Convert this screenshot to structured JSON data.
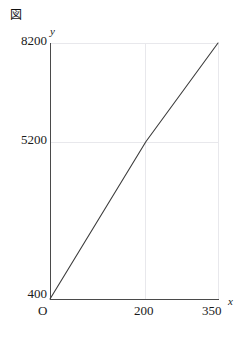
{
  "figure": {
    "marker": "図",
    "marker_name": "figure-label-cjk"
  },
  "chart_data": {
    "type": "line",
    "title": "",
    "subtitle": "",
    "xlabel": "x",
    "ylabel": "y",
    "x": [
      0,
      200,
      350
    ],
    "values": [
      400,
      5200,
      8200
    ],
    "series": [
      {
        "name": "y",
        "points": [
          {
            "x": 0,
            "y": 400
          },
          {
            "x": 200,
            "y": 5200
          },
          {
            "x": 350,
            "y": 8200
          }
        ]
      }
    ],
    "xlim": [
      0,
      350
    ],
    "ylim": [
      400,
      8200
    ],
    "xticks": [
      0,
      200,
      350
    ],
    "xtick_labels": [
      "O",
      "200",
      "350"
    ],
    "yticks": [
      400,
      5200,
      8200
    ],
    "ytick_labels": [
      "400",
      "5200",
      "8200"
    ],
    "origin_label": "O",
    "grid": true,
    "gridlines_x": [
      200,
      350
    ],
    "gridlines_y": [
      5200,
      8200
    ],
    "legend": null,
    "legend_position": "none",
    "line_color": "#3c3c3c",
    "grid_color": "#e8e8ec",
    "axis_color": "#4a4a4a",
    "annotations": []
  },
  "labels": {
    "y_8200": "8200",
    "y_5200": "5200",
    "y_400": "400",
    "x_origin": "O",
    "x_200": "200",
    "x_350": "350",
    "axis_y_name": "y",
    "axis_x_name": "x"
  }
}
